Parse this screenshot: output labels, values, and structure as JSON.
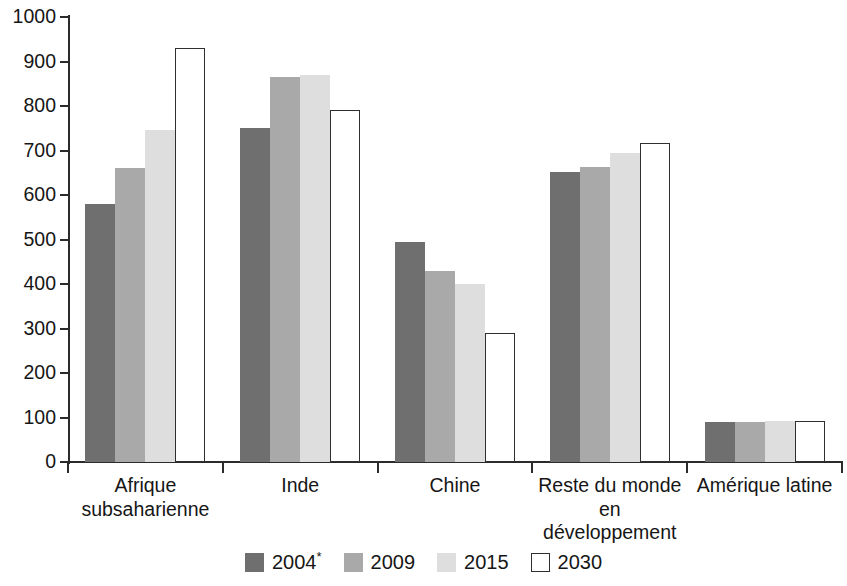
{
  "chart_data": {
    "type": "bar",
    "title": "",
    "xlabel": "",
    "ylabel": "",
    "ylim": [
      0,
      1000
    ],
    "ytick_step": 100,
    "yticks": [
      "1000",
      "900",
      "800",
      "700",
      "600",
      "500",
      "400",
      "300",
      "200",
      "100",
      "0"
    ],
    "grid": false,
    "legend_position": "bottom",
    "categories": [
      "Afrique subsaharienne",
      "Inde",
      "Chine",
      "Reste du monde en développement",
      "Amérique latine"
    ],
    "series": [
      {
        "name": "2004*",
        "color": "#6f6f6f",
        "values": [
          580,
          750,
          494,
          652,
          90
        ]
      },
      {
        "name": "2009",
        "color": "#a9a9a9",
        "values": [
          660,
          865,
          429,
          664,
          91
        ]
      },
      {
        "name": "2015",
        "color": "#dedede",
        "values": [
          745,
          870,
          400,
          694,
          92
        ]
      },
      {
        "name": "2030",
        "color": "#ffffff",
        "values": [
          930,
          792,
          290,
          716,
          93
        ]
      }
    ]
  },
  "legend": {
    "items": [
      {
        "label": "2004",
        "sup": "*",
        "swatch": "s2004"
      },
      {
        "label": "2009",
        "sup": "",
        "swatch": "s2009"
      },
      {
        "label": "2015",
        "sup": "",
        "swatch": "s2015"
      },
      {
        "label": "2030",
        "sup": "",
        "swatch": "s2030"
      }
    ]
  },
  "axis": {
    "y_max": 1000,
    "y_min": 0
  }
}
